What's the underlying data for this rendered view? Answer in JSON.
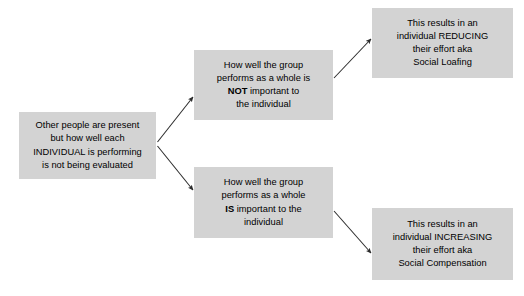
{
  "diagram": {
    "type": "flowchart",
    "box_fill_color": "#d3d3d3",
    "text_color": "#000000",
    "arrow_color": "#333333",
    "nodes": [
      {
        "id": "source",
        "lines": [
          "Other people are present",
          "but how well each",
          "INDIVIDUAL is performing",
          "is not being evaluated"
        ]
      },
      {
        "id": "not",
        "lines": [
          "How well the group",
          "performs as a whole is",
          "NOT important to",
          "the individual"
        ],
        "emphasis": "NOT"
      },
      {
        "id": "is",
        "lines": [
          "How well the group",
          "performs as a whole",
          "IS important to the",
          "individual"
        ],
        "emphasis": "IS"
      },
      {
        "id": "loafing",
        "lines": [
          "This results in an",
          "individual REDUCING",
          "their effort aka",
          "Social Loafing"
        ]
      },
      {
        "id": "compensation",
        "lines": [
          "This results in an",
          "individual INCREASING",
          "their effort aka",
          "Social Compensation"
        ]
      }
    ],
    "edges": [
      {
        "id": "source-to-not",
        "from": "source",
        "to": "not",
        "label": ""
      },
      {
        "id": "source-to-is",
        "from": "source",
        "to": "is",
        "label": ""
      },
      {
        "id": "not-to-loafing",
        "from": "not",
        "to": "loafing",
        "label": ""
      },
      {
        "id": "is-to-compensation",
        "from": "is",
        "to": "compensation",
        "label": ""
      }
    ]
  }
}
